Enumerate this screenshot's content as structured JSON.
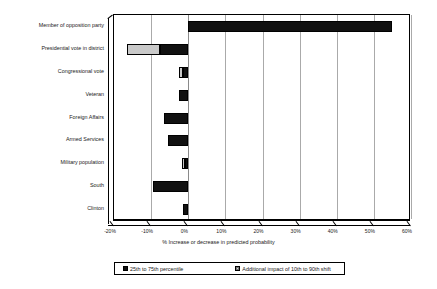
{
  "chart_data": {
    "type": "bar",
    "orientation": "horizontal",
    "title": "",
    "xlabel": "% Increase or decrease in predicted probability",
    "ylabel": "",
    "xlim": [
      -20,
      60
    ],
    "xtick_labels": [
      "-20%",
      "-10%",
      "0%",
      "10%",
      "20%",
      "30%",
      "40%",
      "50%",
      "60%"
    ],
    "xticks": [
      -20,
      -10,
      0,
      10,
      20,
      30,
      40,
      50,
      60
    ],
    "grid": true,
    "legend_position": "bottom",
    "categories": [
      "Member of opposition party",
      "Presidential vote in district",
      "Congressional vote",
      "Veteran",
      "Foreign Affairs",
      "Armed Services",
      "Military population",
      "South",
      "Clinton"
    ],
    "series": [
      {
        "name": "25th to 75th percentile",
        "color": "#111111",
        "values_start": [
          0,
          -7.5,
          -1.5,
          -2.5,
          -6.5,
          -5.5,
          -1.0,
          -9.5,
          -1.5
        ],
        "values_end": [
          55.0,
          0,
          0,
          0,
          0,
          0,
          0,
          0,
          0
        ]
      },
      {
        "name": "Additional impact of 10th to 90th shift",
        "color": "#c9c9c9",
        "values_start": [
          0,
          -16.5,
          -2.5,
          0,
          0,
          0,
          -1.8,
          0,
          0
        ],
        "values_end": [
          0,
          -7.5,
          -1.5,
          0,
          0,
          0,
          -1.0,
          0,
          0
        ]
      }
    ],
    "legend": [
      "25th to 75th percentile",
      "Additional impact of 10th to 90th shift"
    ]
  }
}
